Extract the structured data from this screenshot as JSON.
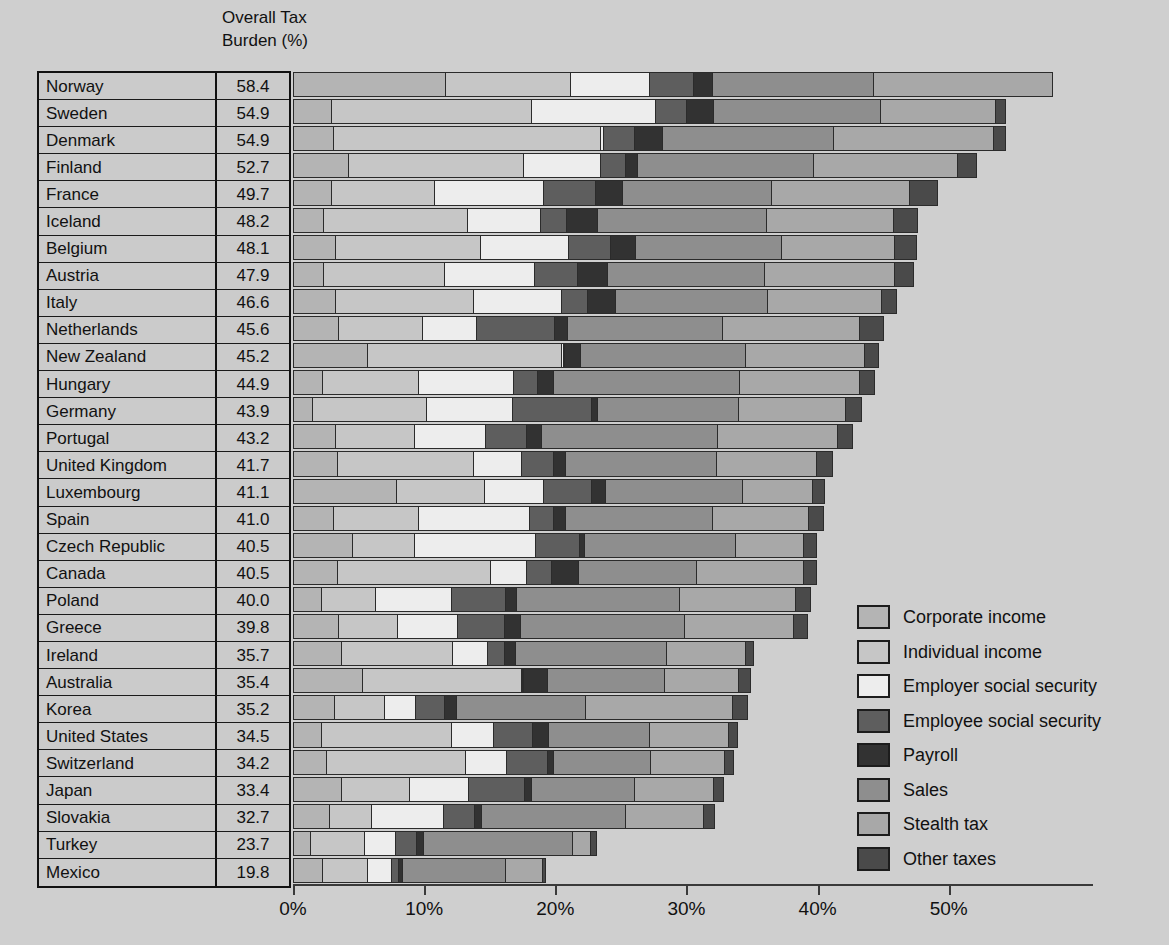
{
  "header": {
    "column_label": "Overall Tax\nBurden (%)"
  },
  "axis": {
    "ticks": [
      "0%",
      "10%",
      "20%",
      "30%",
      "40%",
      "50%"
    ],
    "tick_values": [
      0,
      10,
      20,
      30,
      40,
      50
    ],
    "min": 0,
    "max": 61
  },
  "legend": {
    "items": [
      {
        "label": "Corporate income",
        "color": "#b4b4b4"
      },
      {
        "label": "Individual income",
        "color": "#c6c6c6"
      },
      {
        "label": "Employer social security",
        "color": "#ededed"
      },
      {
        "label": "Employee social security",
        "color": "#5e5e5e"
      },
      {
        "label": "Payroll",
        "color": "#323232"
      },
      {
        "label": "Sales",
        "color": "#8e8e8e"
      },
      {
        "label": "Stealth tax",
        "color": "#a8a8a8"
      },
      {
        "label": "Other taxes",
        "color": "#4a4a4a"
      }
    ]
  },
  "chart_data": {
    "type": "bar",
    "title": "",
    "xlabel": "",
    "ylabel": "",
    "stacked": true,
    "orientation": "horizontal",
    "xlim": [
      0,
      61
    ],
    "grid": false,
    "legend_position": "right-bottom",
    "value_column_header": "Overall Tax Burden (%)",
    "series": [
      {
        "name": "Corporate income",
        "color": "#b4b4b4"
      },
      {
        "name": "Individual income",
        "color": "#c6c6c6"
      },
      {
        "name": "Employer social security",
        "color": "#ededed"
      },
      {
        "name": "Employee social security",
        "color": "#5e5e5e"
      },
      {
        "name": "Payroll",
        "color": "#323232"
      },
      {
        "name": "Sales",
        "color": "#8e8e8e"
      },
      {
        "name": "Stealth tax",
        "color": "#a8a8a8"
      },
      {
        "name": "Other taxes",
        "color": "#4a4a4a"
      }
    ],
    "categories": [
      "Norway",
      "Sweden",
      "Denmark",
      "Finland",
      "France",
      "Iceland",
      "Belgium",
      "Austria",
      "Italy",
      "Netherlands",
      "New Zealand",
      "Hungary",
      "Germany",
      "Portugal",
      "United Kingdom",
      "Luxembourg",
      "Spain",
      "Czech Republic",
      "Canada",
      "Poland",
      "Greece",
      "Ireland",
      "Australia",
      "Korea",
      "United States",
      "Switzerland",
      "Japan",
      "Slovakia",
      "Turkey",
      "Mexico"
    ],
    "totals": [
      58.4,
      54.9,
      54.9,
      52.7,
      49.7,
      48.2,
      48.1,
      47.9,
      46.6,
      45.6,
      45.2,
      44.9,
      43.9,
      43.2,
      41.7,
      41.1,
      41.0,
      40.5,
      40.5,
      40.0,
      39.8,
      35.7,
      35.4,
      35.2,
      34.5,
      34.2,
      33.4,
      32.7,
      23.7,
      19.8
    ],
    "rows": [
      {
        "country": "Norway",
        "total": 58.4,
        "values": [
          11.7,
          9.6,
          6.1,
          3.4,
          1.5,
          12.4,
          13.7,
          0.0
        ]
      },
      {
        "country": "Sweden",
        "total": 54.9,
        "values": [
          3.0,
          15.3,
          9.5,
          2.5,
          2.1,
          12.8,
          8.9,
          0.8
        ]
      },
      {
        "country": "Denmark",
        "total": 54.9,
        "values": [
          3.1,
          20.5,
          0.3,
          2.4,
          2.2,
          13.1,
          12.3,
          1.0
        ]
      },
      {
        "country": "Finland",
        "total": 52.7,
        "values": [
          4.3,
          13.4,
          5.9,
          2.0,
          1.0,
          13.5,
          11.1,
          1.5
        ]
      },
      {
        "country": "France",
        "total": 49.7,
        "values": [
          3.0,
          7.9,
          8.4,
          4.0,
          2.2,
          11.4,
          10.6,
          2.2
        ]
      },
      {
        "country": "Iceland",
        "total": 48.2,
        "values": [
          2.4,
          11.0,
          5.7,
          2.0,
          2.5,
          12.9,
          9.8,
          1.9
        ]
      },
      {
        "country": "Belgium",
        "total": 48.1,
        "values": [
          3.3,
          11.1,
          6.8,
          3.3,
          2.0,
          11.2,
          8.7,
          1.7
        ]
      },
      {
        "country": "Austria",
        "total": 47.9,
        "values": [
          2.4,
          9.3,
          6.9,
          3.4,
          2.3,
          12.1,
          10.0,
          1.5
        ]
      },
      {
        "country": "Italy",
        "total": 46.6,
        "values": [
          3.3,
          10.6,
          6.8,
          2.0,
          2.2,
          11.7,
          8.8,
          1.2
        ]
      },
      {
        "country": "Netherlands",
        "total": 45.6,
        "values": [
          3.5,
          6.5,
          4.2,
          6.0,
          1.1,
          11.9,
          10.5,
          1.9
        ]
      },
      {
        "country": "New Zealand",
        "total": 45.2,
        "values": [
          5.7,
          14.9,
          0.2,
          0.2,
          1.3,
          12.6,
          9.2,
          1.1
        ]
      },
      {
        "country": "Hungary",
        "total": 44.9,
        "values": [
          2.3,
          7.4,
          7.3,
          1.9,
          1.3,
          14.3,
          9.2,
          1.2
        ]
      },
      {
        "country": "Germany",
        "total": 43.9,
        "values": [
          1.5,
          8.8,
          6.6,
          6.1,
          0.6,
          10.8,
          8.2,
          1.3
        ]
      },
      {
        "country": "Portugal",
        "total": 43.2,
        "values": [
          3.3,
          6.1,
          5.5,
          3.2,
          1.2,
          13.5,
          9.2,
          1.2
        ]
      },
      {
        "country": "United Kingdom",
        "total": 41.7,
        "values": [
          3.4,
          10.5,
          3.7,
          2.5,
          1.0,
          11.6,
          7.7,
          1.3
        ]
      },
      {
        "country": "Luxembourg",
        "total": 41.1,
        "values": [
          7.9,
          6.8,
          4.6,
          3.7,
          1.2,
          10.5,
          5.4,
          1.0
        ]
      },
      {
        "country": "Spain",
        "total": 41.0,
        "values": [
          3.1,
          6.6,
          8.5,
          1.9,
          1.0,
          11.3,
          7.4,
          1.2
        ]
      },
      {
        "country": "Czech Republic",
        "total": 40.5,
        "values": [
          4.6,
          4.8,
          9.3,
          3.4,
          0.5,
          11.6,
          5.2,
          1.1
        ]
      },
      {
        "country": "Canada",
        "total": 40.5,
        "values": [
          3.4,
          11.8,
          2.8,
          2.0,
          2.1,
          9.1,
          8.2,
          1.1
        ]
      },
      {
        "country": "Poland",
        "total": 40.0,
        "values": [
          2.2,
          4.2,
          5.9,
          4.2,
          0.9,
          12.5,
          8.9,
          1.2
        ]
      },
      {
        "country": "Greece",
        "total": 39.8,
        "values": [
          3.5,
          4.6,
          4.6,
          3.7,
          1.3,
          12.6,
          8.4,
          1.1
        ]
      },
      {
        "country": "Ireland",
        "total": 35.7,
        "values": [
          3.7,
          8.6,
          2.7,
          1.4,
          0.9,
          11.6,
          6.1,
          0.7
        ]
      },
      {
        "country": "Australia",
        "total": 35.4,
        "values": [
          5.3,
          12.2,
          0.2,
          0.1,
          1.9,
          9.0,
          5.7,
          1.0
        ]
      },
      {
        "country": "Korea",
        "total": 35.2,
        "values": [
          3.2,
          3.9,
          2.4,
          2.3,
          1.0,
          9.9,
          11.3,
          1.2
        ]
      },
      {
        "country": "United States",
        "total": 34.5,
        "values": [
          2.2,
          10.0,
          3.3,
          3.0,
          1.3,
          7.8,
          6.1,
          0.8
        ]
      },
      {
        "country": "Switzerland",
        "total": 34.2,
        "values": [
          2.6,
          10.7,
          3.2,
          3.2,
          0.5,
          7.5,
          5.7,
          0.8
        ]
      },
      {
        "country": "Japan",
        "total": 33.4,
        "values": [
          3.7,
          5.3,
          4.6,
          4.3,
          0.6,
          8.0,
          6.1,
          0.8
        ]
      },
      {
        "country": "Slovakia",
        "total": 32.7,
        "values": [
          2.8,
          3.3,
          5.6,
          2.4,
          0.6,
          11.1,
          6.0,
          0.9
        ]
      },
      {
        "country": "Turkey",
        "total": 23.7,
        "values": [
          1.4,
          4.2,
          2.4,
          1.7,
          0.6,
          11.4,
          1.5,
          0.5
        ]
      },
      {
        "country": "Mexico",
        "total": 19.8,
        "values": [
          2.3,
          3.5,
          1.9,
          0.6,
          0.4,
          7.9,
          2.9,
          0.3
        ]
      }
    ]
  }
}
